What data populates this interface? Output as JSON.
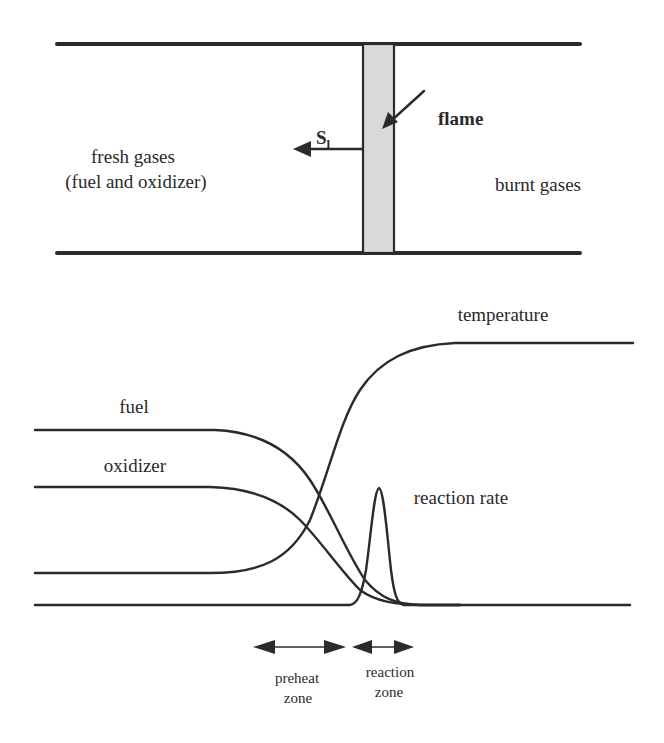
{
  "channel": {
    "fresh_gases_line1": "fresh gases",
    "fresh_gases_line2": "(fuel and oxidizer)",
    "burnt_gases": "burnt gases",
    "flame_label": "flame",
    "speed_label_main": "S",
    "speed_label_sub": "l",
    "flame_band_color": "#d9d9d9"
  },
  "profiles": {
    "temperature": "temperature",
    "fuel": "fuel",
    "oxidizer": "oxidizer",
    "reaction_rate": "reaction rate"
  },
  "zones": {
    "preheat_line1": "preheat",
    "preheat_line2": "zone",
    "reaction_line1": "reaction",
    "reaction_line2": "zone"
  },
  "colors": {
    "ink": "#2b2b2b",
    "background": "#ffffff"
  }
}
